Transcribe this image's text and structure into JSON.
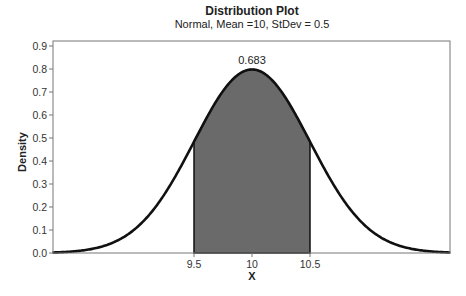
{
  "chart_data": {
    "type": "area",
    "title": "Distribution Plot",
    "subtitle": "Normal, Mean =10, StDev = 0.5",
    "distribution": "Normal",
    "mean": 10,
    "stdev": 0.5,
    "xlabel": "X",
    "ylabel": "Density",
    "xlim": [
      8.28,
      11.71
    ],
    "ylim": [
      0.0,
      0.92
    ],
    "x_ticks": [
      9.5,
      10,
      10.5
    ],
    "x_tick_labels": [
      "9.5",
      "10",
      "10.5"
    ],
    "y_ticks": [
      0.0,
      0.1,
      0.2,
      0.3,
      0.4,
      0.5,
      0.6,
      0.7,
      0.8,
      0.9
    ],
    "y_tick_labels": [
      "0.0",
      "0.1",
      "0.2",
      "0.3",
      "0.4",
      "0.5",
      "0.6",
      "0.7",
      "0.8",
      "0.9"
    ],
    "grid": false,
    "shaded_region": {
      "from": 9.5,
      "to": 10.5,
      "area": 0.683,
      "label": "0.683"
    },
    "peak_density": 0.798,
    "colors": {
      "curve": "#111111",
      "shade": "#6a6a6a",
      "frame": "#777777"
    }
  }
}
